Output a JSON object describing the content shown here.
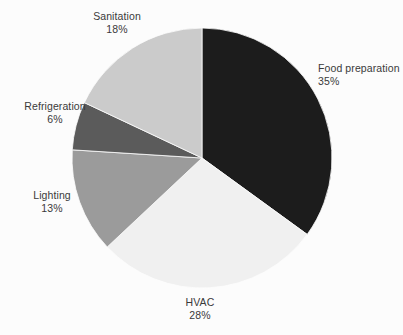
{
  "chart_data": {
    "type": "pie",
    "title": "",
    "subtitle": "",
    "xlabel": "",
    "ylabel": "",
    "legend_position": "none",
    "grid": false,
    "start_angle_deg": 0,
    "direction": "clockwise",
    "units": "percent",
    "total": 100,
    "categories": [
      "Food preparation",
      "HVAC",
      "Sanitation",
      "Lighting",
      "Refrigeration"
    ],
    "values": [
      35,
      28,
      18,
      13,
      6
    ],
    "value_labels": [
      "35%",
      "28%",
      "18%",
      "13%",
      "6%"
    ],
    "colors": [
      "#1c1c1c",
      "#f0f0f0",
      "#cbcbcb",
      "#9b9b9b",
      "#5b5b5b"
    ],
    "slices": [
      {
        "name": "Food preparation",
        "value": 35,
        "value_label": "35%",
        "color": "#1c1c1c",
        "start_deg": 0,
        "end_deg": 126
      },
      {
        "name": "HVAC",
        "value": 28,
        "value_label": "28%",
        "color": "#f0f0f0",
        "start_deg": 126,
        "end_deg": 226.8
      },
      {
        "name": "Lighting",
        "value": 13,
        "value_label": "13%",
        "color": "#9b9b9b",
        "start_deg": 226.8,
        "end_deg": 273.6
      },
      {
        "name": "Refrigeration",
        "value": 6,
        "value_label": "6%",
        "color": "#5b5b5b",
        "start_deg": 273.6,
        "end_deg": 295.2
      },
      {
        "name": "Sanitation",
        "value": 18,
        "value_label": "18%",
        "color": "#cbcbcb",
        "start_deg": 295.2,
        "end_deg": 360
      }
    ]
  },
  "labels": {
    "food": {
      "name": "Food preparation",
      "value": "35%"
    },
    "hvac": {
      "name": "HVAC",
      "value": "28%"
    },
    "sanitation": {
      "name": "Sanitation",
      "value": "18%"
    },
    "lighting": {
      "name": "Lighting",
      "value": "13%"
    },
    "refrigeration": {
      "name": "Refrigeration",
      "value": "6%"
    }
  },
  "style": {
    "background": "#fcfcfc",
    "text_color": "#3a3a3a"
  }
}
